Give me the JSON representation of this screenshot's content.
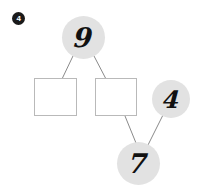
{
  "worksheet": {
    "problem_number": "4",
    "background_color": "#ffffff"
  },
  "diagram": {
    "type": "number-bond-tree",
    "node_fill_color": "#e2e2e2",
    "node_text_color": "#111111",
    "box_border_color": "#b9b9b9",
    "connector_color": "#8a8a8a",
    "nodes": [
      {
        "id": "top",
        "kind": "circle",
        "value": "9",
        "cx": 83.5,
        "cy": 37,
        "r": 21.5
      },
      {
        "id": "left-box",
        "kind": "box",
        "value": "",
        "x": 34,
        "y": 78,
        "w": 43,
        "h": 38
      },
      {
        "id": "right-box",
        "kind": "box",
        "value": "",
        "x": 95,
        "y": 78,
        "w": 42,
        "h": 38
      },
      {
        "id": "right-circle",
        "kind": "circle",
        "value": "4",
        "cx": 171,
        "cy": 99,
        "r": 19
      },
      {
        "id": "bottom",
        "kind": "circle",
        "value": "7",
        "cx": 138.5,
        "cy": 163.5,
        "r": 21.5
      }
    ],
    "connectors": [
      {
        "from": "top",
        "to": "left-box",
        "x1": 73,
        "y1": 56,
        "x2": 62,
        "y2": 79
      },
      {
        "from": "top",
        "to": "right-box",
        "x1": 94,
        "y1": 56,
        "x2": 106,
        "y2": 79
      },
      {
        "from": "right-box",
        "to": "bottom",
        "x1": 125,
        "y1": 116,
        "x2": 136,
        "y2": 143
      },
      {
        "from": "right-circle",
        "to": "bottom",
        "x1": 163,
        "y1": 115,
        "x2": 148,
        "y2": 145
      }
    ]
  }
}
